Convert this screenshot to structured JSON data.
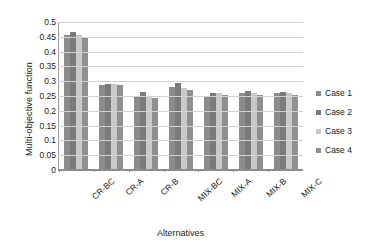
{
  "chart_data": {
    "type": "bar",
    "title": "",
    "xlabel": "Alternatives",
    "ylabel": "Multi-objective function",
    "categories": [
      "CR-BC",
      "CR-A",
      "CR-B",
      "MIX-BC",
      "MIX-A",
      "MIX-B",
      "MIX-C"
    ],
    "series": [
      {
        "name": "Case 1",
        "color": "#8c8c8c",
        "values": [
          0.455,
          0.287,
          0.25,
          0.28,
          0.25,
          0.26,
          0.257
        ]
      },
      {
        "name": "Case 2",
        "color": "#7a7a7a",
        "values": [
          0.467,
          0.289,
          0.262,
          0.292,
          0.26,
          0.265,
          0.263
        ]
      },
      {
        "name": "Case 3",
        "color": "#c9c9c9",
        "values": [
          0.455,
          0.289,
          0.247,
          0.277,
          0.258,
          0.26,
          0.258
        ]
      },
      {
        "name": "Case 4",
        "color": "#909090",
        "values": [
          0.444,
          0.285,
          0.24,
          0.27,
          0.252,
          0.252,
          0.251
        ]
      }
    ],
    "ylim": [
      0,
      0.5
    ],
    "ytick_labels": [
      "0.5",
      "0.45",
      "0.4",
      "0.35",
      "0.3",
      "0.25",
      "0.2",
      "0.15",
      "0.1",
      "0.05",
      "0"
    ],
    "ytick_values": [
      0.5,
      0.45,
      0.4,
      0.35,
      0.3,
      0.25,
      0.2,
      0.15,
      0.1,
      0.05,
      0
    ],
    "grid": true,
    "legend_position": "right",
    "background": "#ffffff",
    "grid_color": "#d2d2d2",
    "axis_color": "#8c8c8c"
  },
  "legend": {
    "items": [
      {
        "label": "Case 1"
      },
      {
        "label": "Case 2"
      },
      {
        "label": "Case 3"
      },
      {
        "label": "Case 4"
      }
    ]
  }
}
